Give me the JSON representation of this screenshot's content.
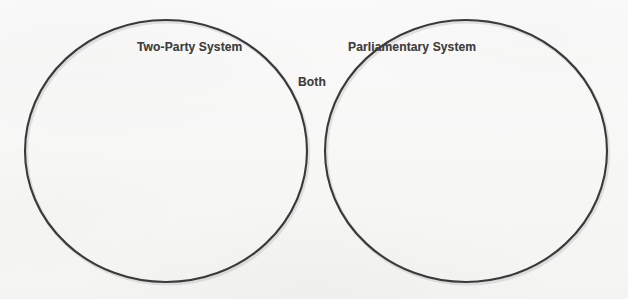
{
  "diagram": {
    "type": "venn",
    "sets": 2,
    "background_color": "#f8f8f7",
    "stroke_color": "#3a3a3a",
    "text_color": "#3f3f3f",
    "left_set": {
      "label": "Two-Party System",
      "center_x": 166,
      "center_y": 151,
      "radius": 141
    },
    "right_set": {
      "label": "Parliamentary System",
      "center_x": 466,
      "center_y": 151,
      "radius": 141
    },
    "intersection": {
      "label": "Both"
    }
  }
}
